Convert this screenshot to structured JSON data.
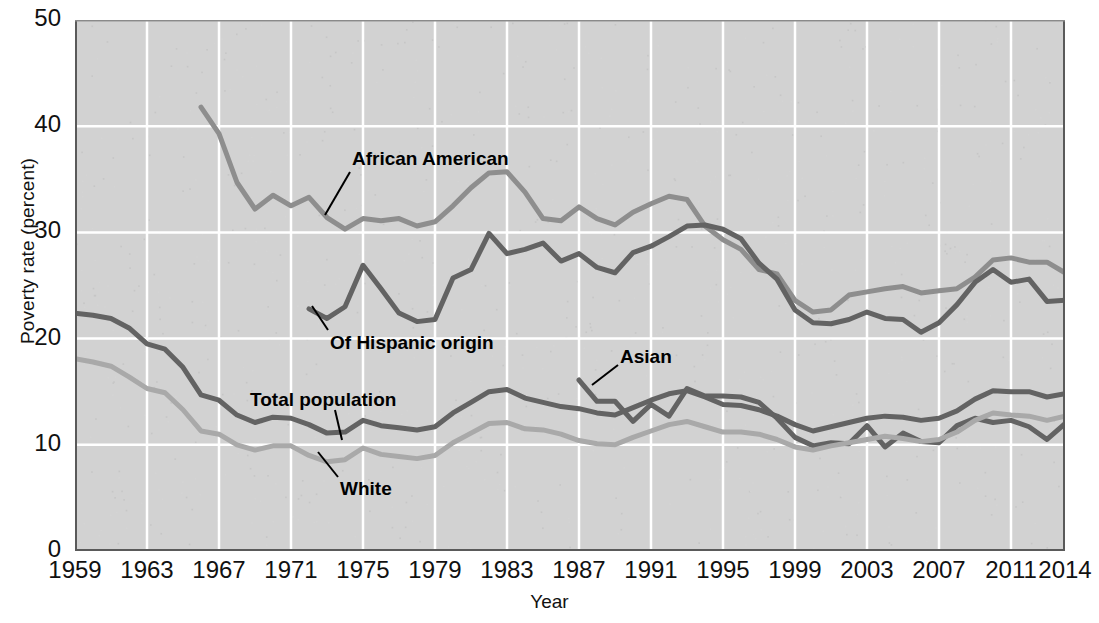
{
  "chart_data": {
    "type": "line",
    "title": "",
    "xlabel": "Year",
    "ylabel": "Poverty rate (percent)",
    "xlim": [
      1959,
      2014
    ],
    "ylim": [
      0,
      50
    ],
    "yticks": [
      0,
      10,
      20,
      30,
      40,
      50
    ],
    "xticks": [
      1959,
      1963,
      1967,
      1971,
      1975,
      1979,
      1983,
      1987,
      1991,
      1995,
      1999,
      2003,
      2007,
      2011,
      2014
    ],
    "grid": true,
    "legend_position": "inline-annotations",
    "plot_background": "#d2d2d2",
    "gridline_color": "#ffffff",
    "series": [
      {
        "name": "African American",
        "color": "#8e8e8e",
        "label_x": 352,
        "label_y": 148,
        "leader": [
          [
            350,
            172
          ],
          [
            325,
            215
          ]
        ],
        "x": [
          1966,
          1967,
          1968,
          1969,
          1970,
          1971,
          1972,
          1973,
          1974,
          1975,
          1976,
          1977,
          1978,
          1979,
          1980,
          1981,
          1982,
          1983,
          1984,
          1985,
          1986,
          1987,
          1988,
          1989,
          1990,
          1991,
          1992,
          1993,
          1994,
          1995,
          1996,
          1997,
          1998,
          1999,
          2000,
          2001,
          2002,
          2003,
          2004,
          2005,
          2006,
          2007,
          2008,
          2009,
          2010,
          2011,
          2012,
          2013,
          2014
        ],
        "y": [
          41.8,
          39.3,
          34.7,
          32.2,
          33.5,
          32.5,
          33.3,
          31.4,
          30.3,
          31.3,
          31.1,
          31.3,
          30.6,
          31.0,
          32.5,
          34.2,
          35.6,
          35.7,
          33.8,
          31.3,
          31.1,
          32.4,
          31.3,
          30.7,
          31.9,
          32.7,
          33.4,
          33.1,
          30.6,
          29.3,
          28.4,
          26.5,
          26.1,
          23.6,
          22.5,
          22.7,
          24.1,
          24.4,
          24.7,
          24.9,
          24.3,
          24.5,
          24.7,
          25.8,
          27.4,
          27.6,
          27.2,
          27.2,
          26.2
        ]
      },
      {
        "name": "Of Hispanic origin",
        "color": "#636363",
        "label_x": 330,
        "label_y": 332,
        "leader": [
          [
            328,
            330
          ],
          [
            312,
            306
          ]
        ],
        "x": [
          1972,
          1973,
          1974,
          1975,
          1976,
          1977,
          1978,
          1979,
          1980,
          1981,
          1982,
          1983,
          1984,
          1985,
          1986,
          1987,
          1988,
          1989,
          1990,
          1991,
          1992,
          1993,
          1994,
          1995,
          1996,
          1997,
          1998,
          1999,
          2000,
          2001,
          2002,
          2003,
          2004,
          2005,
          2006,
          2007,
          2008,
          2009,
          2010,
          2011,
          2012,
          2013,
          2014
        ],
        "y": [
          22.8,
          21.9,
          23.0,
          26.9,
          24.7,
          22.4,
          21.6,
          21.8,
          25.7,
          26.5,
          29.9,
          28.0,
          28.4,
          29.0,
          27.3,
          28.0,
          26.7,
          26.2,
          28.1,
          28.7,
          29.6,
          30.6,
          30.7,
          30.3,
          29.4,
          27.1,
          25.6,
          22.7,
          21.5,
          21.4,
          21.8,
          22.5,
          21.9,
          21.8,
          20.6,
          21.5,
          23.2,
          25.3,
          26.5,
          25.3,
          25.6,
          23.5,
          23.6
        ]
      },
      {
        "name": "Asian",
        "color": "#636363",
        "label_x": 620,
        "label_y": 346,
        "leader": [
          [
            618,
            365
          ],
          [
            592,
            385
          ]
        ],
        "x": [
          1987,
          1988,
          1989,
          1990,
          1991,
          1992,
          1993,
          1994,
          1995,
          1996,
          1997,
          1998,
          1999,
          2000,
          2001,
          2002,
          2003,
          2004,
          2005,
          2006,
          2007,
          2008,
          2009,
          2010,
          2011,
          2012,
          2013,
          2014
        ],
        "y": [
          16.1,
          14.1,
          14.1,
          12.2,
          13.8,
          12.7,
          15.3,
          14.6,
          14.6,
          14.5,
          14.0,
          12.5,
          10.7,
          9.9,
          10.2,
          10.1,
          11.8,
          9.8,
          11.1,
          10.3,
          10.2,
          11.8,
          12.5,
          12.1,
          12.3,
          11.7,
          10.5,
          12.0
        ]
      },
      {
        "name": "Total population",
        "color": "#636363",
        "label_x": 250,
        "label_y": 389,
        "leader": [
          [
            335,
            410
          ],
          [
            342,
            440
          ]
        ],
        "x": [
          1959,
          1960,
          1961,
          1962,
          1963,
          1964,
          1965,
          1966,
          1967,
          1968,
          1969,
          1970,
          1971,
          1972,
          1973,
          1974,
          1975,
          1976,
          1977,
          1978,
          1979,
          1980,
          1981,
          1982,
          1983,
          1984,
          1985,
          1986,
          1987,
          1988,
          1989,
          1990,
          1991,
          1992,
          1993,
          1994,
          1995,
          1996,
          1997,
          1998,
          1999,
          2000,
          2001,
          2002,
          2003,
          2004,
          2005,
          2006,
          2007,
          2008,
          2009,
          2010,
          2011,
          2012,
          2013,
          2014
        ],
        "y": [
          22.4,
          22.2,
          21.9,
          21.0,
          19.5,
          19.0,
          17.3,
          14.7,
          14.2,
          12.8,
          12.1,
          12.6,
          12.5,
          11.9,
          11.1,
          11.2,
          12.3,
          11.8,
          11.6,
          11.4,
          11.7,
          13.0,
          14.0,
          15.0,
          15.2,
          14.4,
          14.0,
          13.6,
          13.4,
          13.0,
          12.8,
          13.5,
          14.2,
          14.8,
          15.1,
          14.5,
          13.8,
          13.7,
          13.3,
          12.7,
          11.9,
          11.3,
          11.7,
          12.1,
          12.5,
          12.7,
          12.6,
          12.3,
          12.5,
          13.2,
          14.3,
          15.1,
          15.0,
          15.0,
          14.5,
          14.8
        ]
      },
      {
        "name": "White",
        "color": "#a9a9a9",
        "label_x": 340,
        "label_y": 478,
        "leader": [
          [
            338,
            477
          ],
          [
            318,
            452
          ]
        ],
        "x": [
          1959,
          1960,
          1961,
          1962,
          1963,
          1964,
          1965,
          1966,
          1967,
          1968,
          1969,
          1970,
          1971,
          1972,
          1973,
          1974,
          1975,
          1976,
          1977,
          1978,
          1979,
          1980,
          1981,
          1982,
          1983,
          1984,
          1985,
          1986,
          1987,
          1988,
          1989,
          1990,
          1991,
          1992,
          1993,
          1994,
          1995,
          1996,
          1997,
          1998,
          1999,
          2000,
          2001,
          2002,
          2003,
          2004,
          2005,
          2006,
          2007,
          2008,
          2009,
          2010,
          2011,
          2012,
          2013,
          2014
        ],
        "y": [
          18.1,
          17.8,
          17.4,
          16.4,
          15.3,
          14.9,
          13.3,
          11.3,
          11.0,
          10.0,
          9.5,
          9.9,
          9.9,
          9.0,
          8.4,
          8.6,
          9.7,
          9.1,
          8.9,
          8.7,
          9.0,
          10.2,
          11.1,
          12.0,
          12.1,
          11.5,
          11.4,
          11.0,
          10.4,
          10.1,
          10.0,
          10.7,
          11.3,
          11.9,
          12.2,
          11.7,
          11.2,
          11.2,
          11.0,
          10.5,
          9.8,
          9.5,
          9.9,
          10.2,
          10.5,
          10.8,
          10.6,
          10.3,
          10.5,
          11.2,
          12.3,
          13.0,
          12.8,
          12.7,
          12.3,
          12.7
        ]
      }
    ]
  },
  "axis": {
    "y_title": "Poverty rate (percent)",
    "x_title": "Year",
    "y_tick_labels": [
      "50",
      "40",
      "30",
      "20",
      "10",
      "0"
    ],
    "x_tick_labels": [
      "1959",
      "1963",
      "1967",
      "1971",
      "1975",
      "1979",
      "1983",
      "1987",
      "1991",
      "1995",
      "1999",
      "2003",
      "2007",
      "2011",
      "2014"
    ]
  },
  "series_labels": {
    "african_american": "African American",
    "hispanic": "Of Hispanic origin",
    "asian": "Asian",
    "total_population": "Total population",
    "white": "White"
  }
}
